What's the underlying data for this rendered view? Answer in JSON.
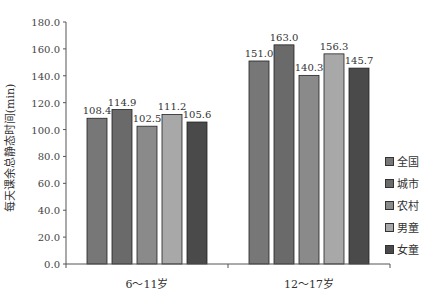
{
  "chart_data": {
    "type": "bar",
    "title": "",
    "xlabel": "",
    "ylabel": "每天课余总静态时间(min)",
    "ylim": [
      0,
      180
    ],
    "yticks": [
      "0.0",
      "20.0",
      "40.0",
      "60.0",
      "80.0",
      "100.0",
      "120.0",
      "140.0",
      "160.0",
      "180.0"
    ],
    "categories": [
      "6～11岁",
      "12～17岁"
    ],
    "series": [
      {
        "name": "全国",
        "color": "#777777",
        "values": [
          108.4,
          151.0
        ]
      },
      {
        "name": "城市",
        "color": "#6a6a6a",
        "values": [
          114.9,
          163.0
        ]
      },
      {
        "name": "农村",
        "color": "#8a8a8a",
        "values": [
          102.5,
          140.3
        ]
      },
      {
        "name": "男童",
        "color": "#a8a8a8",
        "values": [
          111.2,
          156.3
        ]
      },
      {
        "name": "女童",
        "color": "#4a4a4a",
        "values": [
          105.6,
          145.7
        ]
      }
    ],
    "data_labels": [
      "108.4",
      "114.9",
      "102.5",
      "111.2",
      "105.6",
      "151.0",
      "163.0",
      "140.3",
      "156.3",
      "145.7"
    ],
    "legend_position": "right",
    "grid": false
  },
  "legend": {
    "items": [
      "全国",
      "城市",
      "农村",
      "男童",
      "女童"
    ]
  }
}
